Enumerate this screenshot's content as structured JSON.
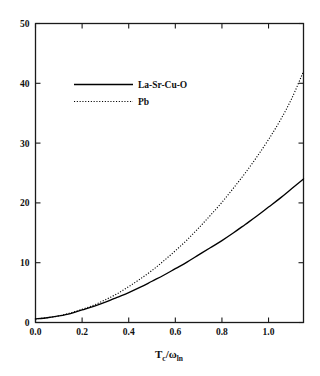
{
  "chart_data": {
    "type": "line",
    "title": "",
    "subtitle": "",
    "xlabel": "T_c/ω_ln",
    "xlabel_parts": {
      "base1": "T",
      "sub1": "c",
      "slash": "/",
      "base2": "ω",
      "sub2": "ln"
    },
    "ylabel": "",
    "xlim": [
      0.0,
      1.15
    ],
    "ylim": [
      0,
      50
    ],
    "xticks": [
      0.0,
      0.2,
      0.4,
      0.6,
      0.8,
      1.0
    ],
    "xtick_labels": [
      "0.0",
      "0.2",
      "0.4",
      "0.6",
      "0.8",
      "1.0"
    ],
    "yticks": [
      0,
      10,
      20,
      30,
      40,
      50
    ],
    "ytick_labels": [
      "0",
      "10",
      "20",
      "30",
      "40",
      "50"
    ],
    "grid": false,
    "legend_position": "upper-left-inside",
    "tick_direction": "in",
    "frame": "box-all-four-sides",
    "series": [
      {
        "name": "La-Sr-Cu-O",
        "style": "solid",
        "color": "#000000",
        "x": [
          0.0,
          0.05,
          0.1,
          0.15,
          0.2,
          0.25,
          0.3,
          0.35,
          0.4,
          0.45,
          0.5,
          0.55,
          0.6,
          0.65,
          0.7,
          0.75,
          0.8,
          0.85,
          0.9,
          0.95,
          1.0,
          1.05,
          1.1,
          1.15
        ],
        "y": [
          0.6,
          0.8,
          1.1,
          1.5,
          2.1,
          2.7,
          3.4,
          4.2,
          5.0,
          5.9,
          6.9,
          7.9,
          9.0,
          10.1,
          11.3,
          12.5,
          13.7,
          15.0,
          16.4,
          17.8,
          19.3,
          20.8,
          22.4,
          24.0
        ]
      },
      {
        "name": "Pb",
        "style": "dotted",
        "color": "#000000",
        "x": [
          0.0,
          0.05,
          0.1,
          0.15,
          0.2,
          0.25,
          0.3,
          0.35,
          0.4,
          0.45,
          0.5,
          0.55,
          0.6,
          0.65,
          0.7,
          0.75,
          0.8,
          0.85,
          0.9,
          0.95,
          1.0,
          1.05,
          1.1,
          1.15
        ],
        "y": [
          0.6,
          0.8,
          1.1,
          1.6,
          2.2,
          2.9,
          3.8,
          4.8,
          6.0,
          7.3,
          8.7,
          10.3,
          12.0,
          13.8,
          15.8,
          17.9,
          20.1,
          22.5,
          25.0,
          27.7,
          30.6,
          33.8,
          37.5,
          42.0
        ]
      }
    ]
  },
  "legend": {
    "entries": [
      {
        "label": "La-Sr-Cu-O",
        "style": "solid"
      },
      {
        "label": "Pb",
        "style": "dotted"
      }
    ]
  }
}
